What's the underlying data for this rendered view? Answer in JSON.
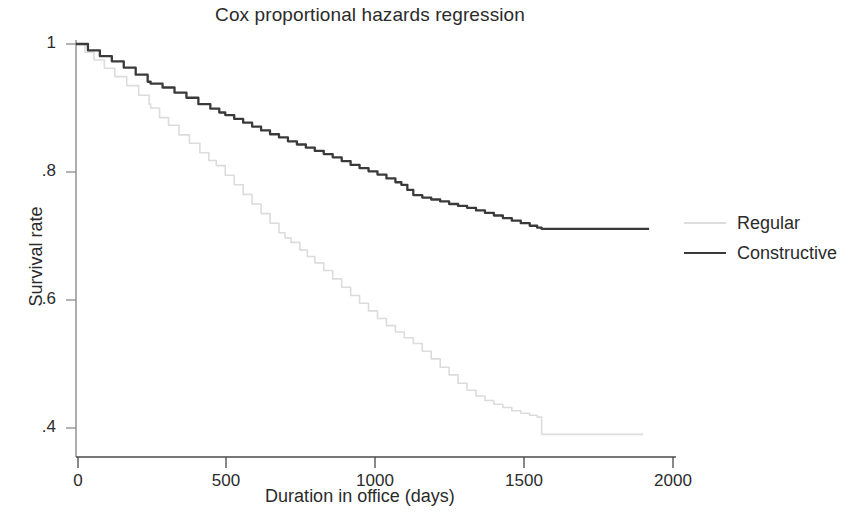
{
  "chart_data": {
    "type": "line",
    "title": "Cox proportional hazards regression",
    "xlabel": "Duration in office (days)",
    "ylabel": "Survival rate",
    "xlim": [
      0,
      2000
    ],
    "ylim": [
      0.36,
      1.02
    ],
    "xticks": [
      0,
      500,
      1000,
      1500,
      2000
    ],
    "xtick_labels": [
      "0",
      "500",
      "1000",
      "1500",
      "2000"
    ],
    "yticks": [
      0.4,
      0.6,
      0.8,
      1
    ],
    "ytick_labels": [
      ".4",
      ".6",
      ".8",
      "1"
    ],
    "grid": false,
    "legend_position": "right",
    "series": [
      {
        "name": "Regular",
        "color": "#dcdcdc",
        "style": "solid-light",
        "x": [
          0,
          30,
          60,
          95,
          130,
          170,
          210,
          245,
          250,
          280,
          310,
          345,
          380,
          415,
          445,
          470,
          500,
          530,
          560,
          590,
          620,
          650,
          680,
          700,
          720,
          750,
          775,
          800,
          830,
          860,
          890,
          920,
          950,
          980,
          1010,
          1040,
          1070,
          1100,
          1130,
          1160,
          1190,
          1220,
          1250,
          1280,
          1310,
          1340,
          1370,
          1400,
          1430,
          1460,
          1490,
          1520,
          1545,
          1560,
          1600,
          1700,
          1800,
          1900
        ],
        "y": [
          1.0,
          0.987,
          0.975,
          0.962,
          0.949,
          0.935,
          0.92,
          0.906,
          0.9,
          0.885,
          0.873,
          0.858,
          0.845,
          0.83,
          0.818,
          0.81,
          0.795,
          0.78,
          0.765,
          0.75,
          0.735,
          0.72,
          0.705,
          0.697,
          0.69,
          0.678,
          0.668,
          0.658,
          0.646,
          0.633,
          0.62,
          0.607,
          0.595,
          0.583,
          0.571,
          0.56,
          0.55,
          0.541,
          0.532,
          0.52,
          0.508,
          0.495,
          0.483,
          0.47,
          0.459,
          0.45,
          0.443,
          0.437,
          0.432,
          0.427,
          0.423,
          0.42,
          0.417,
          0.39,
          0.39,
          0.39,
          0.39,
          0.39
        ]
      },
      {
        "name": "Constructive",
        "color": "#3a3a3a",
        "style": "solid",
        "x": [
          0,
          40,
          80,
          120,
          160,
          200,
          240,
          250,
          290,
          330,
          370,
          410,
          450,
          480,
          500,
          530,
          560,
          590,
          620,
          650,
          680,
          710,
          740,
          770,
          800,
          830,
          860,
          890,
          920,
          950,
          980,
          1010,
          1040,
          1070,
          1090,
          1110,
          1130,
          1160,
          1190,
          1220,
          1250,
          1280,
          1310,
          1340,
          1370,
          1400,
          1430,
          1460,
          1490,
          1520,
          1545,
          1560,
          1600,
          1700,
          1800,
          1920
        ],
        "y": [
          1.0,
          0.99,
          0.981,
          0.973,
          0.963,
          0.952,
          0.941,
          0.938,
          0.932,
          0.924,
          0.916,
          0.906,
          0.899,
          0.893,
          0.889,
          0.883,
          0.877,
          0.871,
          0.865,
          0.859,
          0.854,
          0.848,
          0.843,
          0.838,
          0.833,
          0.828,
          0.823,
          0.817,
          0.811,
          0.806,
          0.801,
          0.796,
          0.79,
          0.784,
          0.78,
          0.772,
          0.764,
          0.76,
          0.757,
          0.754,
          0.75,
          0.747,
          0.744,
          0.74,
          0.736,
          0.732,
          0.728,
          0.724,
          0.72,
          0.716,
          0.713,
          0.711,
          0.711,
          0.711,
          0.711,
          0.711
        ]
      }
    ]
  },
  "title": "Cox proportional hazards regression",
  "axes": {
    "x_title": "Duration in office (days)",
    "y_title": "Survival rate",
    "x_tick_0": "0",
    "x_tick_1": "500",
    "x_tick_2": "1000",
    "x_tick_3": "1500",
    "x_tick_4": "2000",
    "y_tick_0": "1",
    "y_tick_1": ".8",
    "y_tick_2": ".6",
    "y_tick_3": ".4"
  },
  "legend": {
    "items": [
      {
        "label": "Regular",
        "color": "#dcdcdc"
      },
      {
        "label": "Constructive",
        "color": "#3a3a3a"
      }
    ]
  }
}
